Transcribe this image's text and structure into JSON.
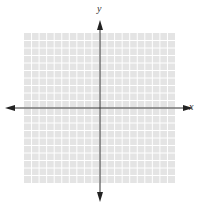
{
  "diagram": {
    "type": "coordinate-plane",
    "x_axis_label": "x",
    "y_axis_label": "y",
    "grid": {
      "columns": 20,
      "rows": 20,
      "background": "#e4e4e4",
      "line_color": "#ffffff"
    },
    "axis_color": "#333333"
  }
}
